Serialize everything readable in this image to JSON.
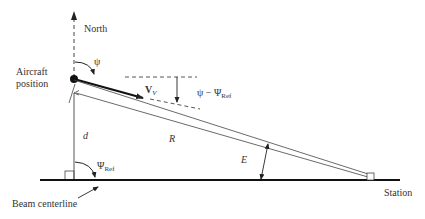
{
  "diagram": {
    "labels": {
      "north": "North",
      "psi": "ψ",
      "aircraft_position_line1": "Aircraft",
      "aircraft_position_line2": "position",
      "velocity": "V",
      "velocity_sub": "V",
      "heading_error": "ψ − Ψ",
      "heading_error_sub": "Ref",
      "d": "d",
      "R": "R",
      "E": "E",
      "psi_ref": "Ψ",
      "psi_ref_sub": "Ref",
      "beam_centerline": "Beam centerline",
      "station": "Station"
    },
    "colors": {
      "line": "#222222",
      "thin_line": "#444444",
      "background": "#ffffff"
    }
  }
}
